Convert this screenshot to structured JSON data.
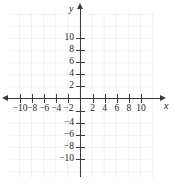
{
  "figure": {
    "background_color": "#ffffff",
    "axis_color": "#3b3b3b",
    "grid_color": "#f2f2f2",
    "label_color": "#231f20"
  },
  "chart_data": {
    "type": "scatter",
    "title": "",
    "subtitle": "",
    "xlabel": "x",
    "ylabel": "y",
    "xlim": [
      -11,
      11
    ],
    "ylim": [
      -11,
      11
    ],
    "grid": true,
    "legend": null,
    "series": [],
    "x_tick_values": [
      -10,
      -8,
      -6,
      -4,
      -2,
      2,
      4,
      6,
      8,
      10
    ],
    "x_tick_labels": [
      "-10",
      "-8",
      "-6",
      "-4",
      "-2",
      "2",
      "4",
      "6",
      "8",
      "10"
    ],
    "y_tick_values": [
      10,
      8,
      6,
      4,
      2,
      -4,
      -6,
      -8,
      -10
    ],
    "y_tick_labels": [
      "10",
      "8",
      "6",
      "4",
      "2",
      "-4",
      "-6",
      "-8",
      "-10"
    ],
    "x_tick_positions_all": [
      -10,
      -8,
      -6,
      -4,
      -2,
      0,
      2,
      4,
      6,
      8,
      10
    ],
    "y_tick_positions_all": [
      10,
      8,
      6,
      4,
      2,
      -2,
      -4,
      -6,
      -8,
      -10
    ],
    "tick_interval": 2,
    "annotations": [],
    "data_points": []
  }
}
